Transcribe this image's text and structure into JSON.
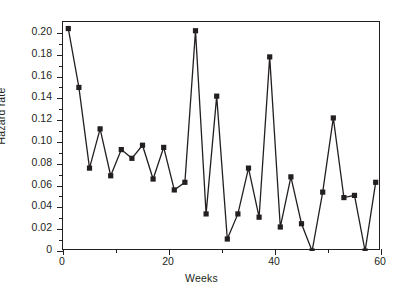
{
  "chart_data": {
    "type": "line",
    "title": "",
    "subtitle": "",
    "xlabel": "Weeks",
    "ylabel": "Hazard rate",
    "xlim": [
      0,
      60
    ],
    "ylim": [
      0,
      0.21
    ],
    "grid": false,
    "legend": null,
    "marker": "filled-square",
    "line_color": "#231f20",
    "marker_color": "#231f20",
    "x_ticks": [
      0,
      20,
      40,
      60
    ],
    "x_tick_labels": [
      "0",
      "20",
      "40",
      "60"
    ],
    "x_minor_ticks": [
      10,
      30,
      50
    ],
    "y_ticks": [
      0,
      0.02,
      0.04,
      0.06,
      0.08,
      0.1,
      0.12,
      0.14,
      0.16,
      0.18,
      0.2
    ],
    "y_tick_labels": [
      "0",
      "0.02",
      "0.04",
      "0.06",
      "0.08",
      "0.10",
      "0.12",
      "0.14",
      "0.16",
      "0.18",
      "0.20"
    ],
    "y_minor_ticks": [
      0.01,
      0.03,
      0.05,
      0.07,
      0.09,
      0.11,
      0.13,
      0.15,
      0.17,
      0.19
    ],
    "series": [
      {
        "name": "Hazard rate",
        "x": [
          1,
          3,
          5,
          7,
          9,
          11,
          13,
          15,
          17,
          19,
          21,
          23,
          25,
          27,
          29,
          31,
          33,
          35,
          37,
          39,
          41,
          43,
          45,
          47,
          49,
          51,
          53,
          55,
          57,
          59
        ],
        "values": [
          0.204,
          0.15,
          0.076,
          0.112,
          0.069,
          0.093,
          0.085,
          0.097,
          0.066,
          0.095,
          0.056,
          0.063,
          0.202,
          0.034,
          0.142,
          0.011,
          0.034,
          0.076,
          0.031,
          0.178,
          0.022,
          0.068,
          0.025,
          0.0,
          0.054,
          0.122,
          0.049,
          0.051,
          0.0,
          0.063
        ]
      }
    ]
  }
}
